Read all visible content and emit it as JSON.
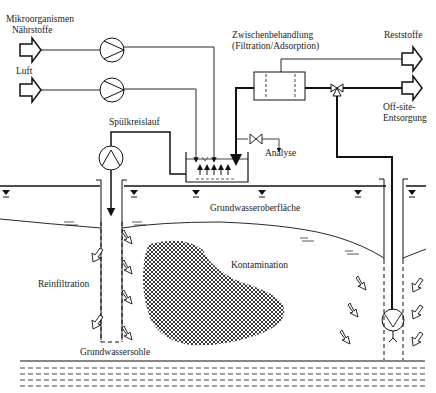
{
  "diagram": {
    "labels": {
      "inputs_top": [
        "Mikroorganismen",
        "Nährstoffe"
      ],
      "input_air": "Luft",
      "treatment": [
        "Zwischenbehandlung",
        "(Filtration/Adsorption)"
      ],
      "residue": "Reststoffe",
      "offsite": [
        "Off-site-",
        "Entsorgung"
      ],
      "flush_loop": "Spülkreislauf",
      "analysis": "Analyse",
      "water_table": "Grundwasseroberfläche",
      "reinfiltration": "Reinfiltration",
      "contamination": "Kontamination",
      "aquifer_base": "Grundwassersohle"
    },
    "components": [
      {
        "name": "pump-nutrients",
        "type": "pump"
      },
      {
        "name": "pump-air",
        "type": "pump"
      },
      {
        "name": "pump-recirculation",
        "type": "pump"
      },
      {
        "name": "infiltration-basin",
        "type": "tank"
      },
      {
        "name": "treatment-unit",
        "type": "filter"
      },
      {
        "name": "three-way-valve",
        "type": "valve"
      },
      {
        "name": "sampling-valve",
        "type": "valve"
      },
      {
        "name": "extraction-well-pump",
        "type": "submersible-pump"
      }
    ],
    "colors": {
      "line": "#111111",
      "background": "#ffffff",
      "hatch": "#222222"
    }
  }
}
